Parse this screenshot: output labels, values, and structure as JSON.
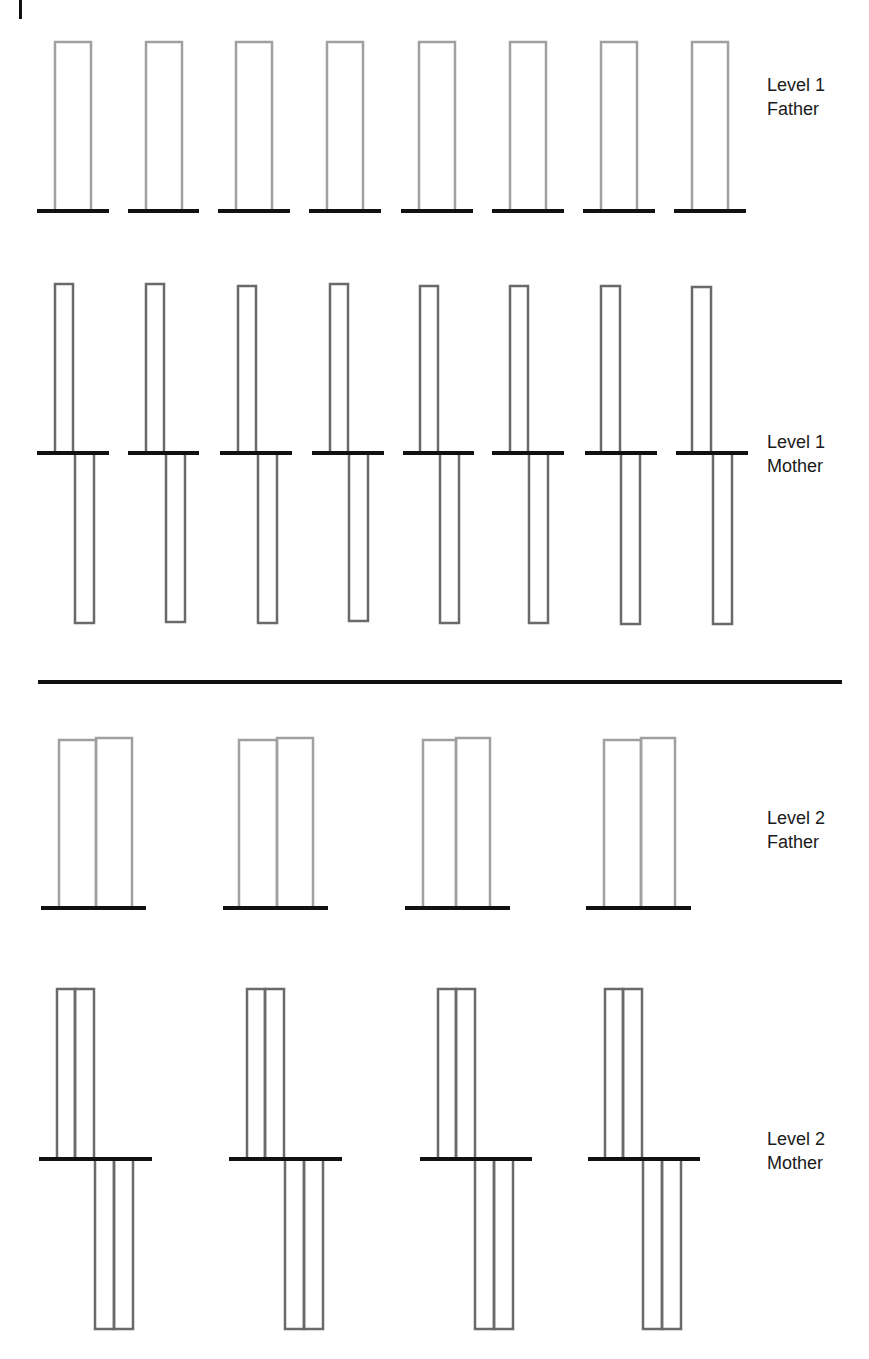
{
  "colors": {
    "father_bar": "#a0a0a0",
    "mother_bar": "#6a6a6a",
    "baseline": "#111111",
    "divider": "#111111",
    "text": "#1a1a1a"
  },
  "corner_mark": {
    "x": 19,
    "y": 0,
    "w": 3,
    "h": 19
  },
  "divider": {
    "x1": 38,
    "x2": 842,
    "y": 682,
    "thickness": 4
  },
  "labels": [
    {
      "id": "level1-father",
      "line1": "Level 1",
      "line2": "Father",
      "x": 767,
      "y": 73
    },
    {
      "id": "level1-mother",
      "line1": "Level 1",
      "line2": "Mother",
      "x": 767,
      "y": 430
    },
    {
      "id": "level2-father",
      "line1": "Level 2",
      "line2": "Father",
      "x": 767,
      "y": 806
    },
    {
      "id": "level2-mother",
      "line1": "Level 2",
      "line2": "Mother",
      "x": 767,
      "y": 1127
    }
  ],
  "rows": {
    "level1_father": {
      "baseline_y": 211,
      "units": [
        {
          "base": [
            37,
            109
          ],
          "bars": [
            {
              "x": 55,
              "w": 36,
              "top": 42,
              "bottom": 211
            }
          ]
        },
        {
          "base": [
            128,
            199
          ],
          "bars": [
            {
              "x": 146,
              "w": 36,
              "top": 42,
              "bottom": 211
            }
          ]
        },
        {
          "base": [
            218,
            290
          ],
          "bars": [
            {
              "x": 236,
              "w": 36,
              "top": 42,
              "bottom": 211
            }
          ]
        },
        {
          "base": [
            309,
            381
          ],
          "bars": [
            {
              "x": 327,
              "w": 36,
              "top": 42,
              "bottom": 211
            }
          ]
        },
        {
          "base": [
            401,
            473
          ],
          "bars": [
            {
              "x": 419,
              "w": 36,
              "top": 42,
              "bottom": 211
            }
          ]
        },
        {
          "base": [
            492,
            564
          ],
          "bars": [
            {
              "x": 510,
              "w": 36,
              "top": 42,
              "bottom": 211
            }
          ]
        },
        {
          "base": [
            583,
            655
          ],
          "bars": [
            {
              "x": 601,
              "w": 36,
              "top": 42,
              "bottom": 211
            }
          ]
        },
        {
          "base": [
            674,
            746
          ],
          "bars": [
            {
              "x": 692,
              "w": 36,
              "top": 42,
              "bottom": 211
            }
          ]
        }
      ]
    },
    "level1_mother": {
      "baseline_y": 453,
      "units": [
        {
          "base": [
            37,
            109
          ],
          "bars": [
            {
              "x": 55,
              "w": 18,
              "top": 284,
              "bottom": 453
            },
            {
              "x": 75,
              "w": 19,
              "top": 453,
              "bottom": 623
            }
          ]
        },
        {
          "base": [
            128,
            199
          ],
          "bars": [
            {
              "x": 146,
              "w": 18,
              "top": 284,
              "bottom": 453
            },
            {
              "x": 166,
              "w": 19,
              "top": 453,
              "bottom": 622
            }
          ]
        },
        {
          "base": [
            220,
            292
          ],
          "bars": [
            {
              "x": 238,
              "w": 18,
              "top": 286,
              "bottom": 453
            },
            {
              "x": 258,
              "w": 19,
              "top": 453,
              "bottom": 623
            }
          ]
        },
        {
          "base": [
            312,
            384
          ],
          "bars": [
            {
              "x": 330,
              "w": 18,
              "top": 284,
              "bottom": 453
            },
            {
              "x": 349,
              "w": 19,
              "top": 453,
              "bottom": 621
            }
          ]
        },
        {
          "base": [
            403,
            474
          ],
          "bars": [
            {
              "x": 420,
              "w": 18,
              "top": 286,
              "bottom": 453
            },
            {
              "x": 440,
              "w": 19,
              "top": 453,
              "bottom": 623
            }
          ]
        },
        {
          "base": [
            492,
            564
          ],
          "bars": [
            {
              "x": 510,
              "w": 18,
              "top": 286,
              "bottom": 453
            },
            {
              "x": 529,
              "w": 19,
              "top": 453,
              "bottom": 623
            }
          ]
        },
        {
          "base": [
            585,
            657
          ],
          "bars": [
            {
              "x": 601,
              "w": 19,
              "top": 286,
              "bottom": 453
            },
            {
              "x": 621,
              "w": 19,
              "top": 453,
              "bottom": 624
            }
          ]
        },
        {
          "base": [
            676,
            748
          ],
          "bars": [
            {
              "x": 692,
              "w": 19,
              "top": 287,
              "bottom": 453
            },
            {
              "x": 713,
              "w": 19,
              "top": 453,
              "bottom": 624
            }
          ]
        }
      ]
    },
    "level2_father": {
      "baseline_y": 908,
      "units": [
        {
          "base": [
            41,
            146
          ],
          "bars": [
            {
              "x": 59,
              "w": 37,
              "top": 740,
              "bottom": 908
            },
            {
              "x": 96,
              "w": 36,
              "top": 738,
              "bottom": 908
            }
          ]
        },
        {
          "base": [
            223,
            328
          ],
          "bars": [
            {
              "x": 239,
              "w": 38,
              "top": 740,
              "bottom": 908
            },
            {
              "x": 277,
              "w": 36,
              "top": 738,
              "bottom": 908
            }
          ]
        },
        {
          "base": [
            405,
            510
          ],
          "bars": [
            {
              "x": 423,
              "w": 33,
              "top": 740,
              "bottom": 908
            },
            {
              "x": 456,
              "w": 34,
              "top": 738,
              "bottom": 908
            }
          ]
        },
        {
          "base": [
            586,
            691
          ],
          "bars": [
            {
              "x": 604,
              "w": 37,
              "top": 740,
              "bottom": 908
            },
            {
              "x": 641,
              "w": 34,
              "top": 738,
              "bottom": 908
            }
          ]
        }
      ]
    },
    "level2_mother": {
      "baseline_y": 1159,
      "units": [
        {
          "base": [
            39,
            152
          ],
          "bars": [
            {
              "x": 57,
              "w": 18,
              "top": 989,
              "bottom": 1159
            },
            {
              "x": 75,
              "w": 19,
              "top": 989,
              "bottom": 1159
            },
            {
              "x": 95,
              "w": 19,
              "top": 1159,
              "bottom": 1329
            },
            {
              "x": 114,
              "w": 19,
              "top": 1159,
              "bottom": 1329
            }
          ]
        },
        {
          "base": [
            229,
            342
          ],
          "bars": [
            {
              "x": 247,
              "w": 18,
              "top": 989,
              "bottom": 1159
            },
            {
              "x": 265,
              "w": 19,
              "top": 989,
              "bottom": 1159
            },
            {
              "x": 285,
              "w": 19,
              "top": 1159,
              "bottom": 1329
            },
            {
              "x": 304,
              "w": 19,
              "top": 1159,
              "bottom": 1329
            }
          ]
        },
        {
          "base": [
            420,
            532
          ],
          "bars": [
            {
              "x": 438,
              "w": 18,
              "top": 989,
              "bottom": 1159
            },
            {
              "x": 456,
              "w": 19,
              "top": 989,
              "bottom": 1159
            },
            {
              "x": 475,
              "w": 19,
              "top": 1159,
              "bottom": 1329
            },
            {
              "x": 494,
              "w": 19,
              "top": 1159,
              "bottom": 1329
            }
          ]
        },
        {
          "base": [
            588,
            700
          ],
          "bars": [
            {
              "x": 605,
              "w": 18,
              "top": 989,
              "bottom": 1159
            },
            {
              "x": 623,
              "w": 19,
              "top": 989,
              "bottom": 1159
            },
            {
              "x": 643,
              "w": 19,
              "top": 1159,
              "bottom": 1329
            },
            {
              "x": 662,
              "w": 19,
              "top": 1159,
              "bottom": 1329
            }
          ]
        }
      ]
    }
  }
}
